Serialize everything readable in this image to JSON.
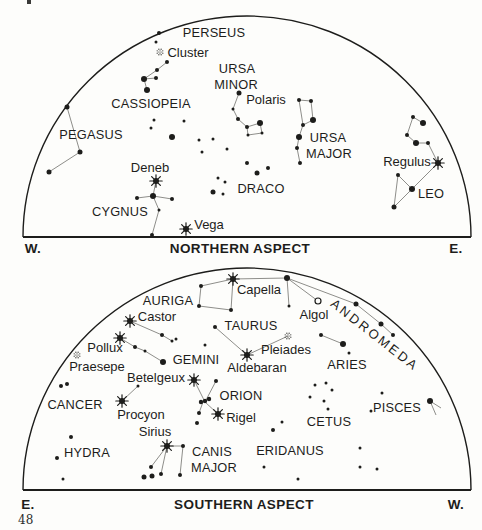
{
  "page": {
    "number": "48",
    "ink": "#1d1d1b",
    "line_gray": "#8e8e8a",
    "bg": "#fdfdfb"
  },
  "charts": [
    {
      "id": "northern-aspect",
      "arc": {
        "cx": 247,
        "cy": 237,
        "rx": 224,
        "ry": 221
      },
      "footer": {
        "left": "W.",
        "center": "NORTHERN ASPECT",
        "right": "E.",
        "y": 248,
        "left_x": 33,
        "center_x": 240,
        "right_x": 456
      },
      "labels": [
        {
          "t": "PERSEUS",
          "x": 214,
          "y": 32,
          "k": "con"
        },
        {
          "t": "Cluster",
          "x": 188,
          "y": 52,
          "k": "name"
        },
        {
          "t": "CASSIOPEIA",
          "x": 151,
          "y": 103,
          "k": "con"
        },
        {
          "t": "PEGASUS",
          "x": 91,
          "y": 134,
          "k": "con"
        },
        {
          "t": "URSA",
          "x": 237,
          "y": 68,
          "k": "con"
        },
        {
          "t": "MINOR",
          "x": 236,
          "y": 84,
          "k": "con"
        },
        {
          "t": "Polaris",
          "x": 266,
          "y": 99,
          "k": "name"
        },
        {
          "t": "URSA",
          "x": 328,
          "y": 137,
          "k": "con"
        },
        {
          "t": "MAJOR",
          "x": 329,
          "y": 153,
          "k": "con"
        },
        {
          "t": "DRACO",
          "x": 261,
          "y": 188,
          "k": "con"
        },
        {
          "t": "Deneb",
          "x": 150,
          "y": 167,
          "k": "name"
        },
        {
          "t": "CYGNUS",
          "x": 120,
          "y": 211,
          "k": "con"
        },
        {
          "t": "Vega",
          "x": 209,
          "y": 224,
          "k": "name"
        },
        {
          "t": "Regulus",
          "x": 407,
          "y": 161,
          "k": "name"
        },
        {
          "t": "LEO",
          "x": 431,
          "y": 193,
          "k": "con"
        }
      ],
      "stars": [
        [
          159,
          33,
          2
        ],
        [
          156,
          42,
          1.5
        ],
        [
          167,
          62,
          2
        ],
        [
          157,
          70,
          2
        ],
        [
          144,
          79,
          3
        ],
        [
          156,
          78,
          2
        ],
        [
          147,
          90,
          3
        ],
        [
          67,
          107,
          2.5
        ],
        [
          80,
          152,
          2.5
        ],
        [
          49,
          172,
          2.5
        ],
        [
          154,
          120,
          1.5
        ],
        [
          151,
          128,
          1.5
        ],
        [
          184,
          121,
          1.5
        ],
        [
          172,
          137,
          3
        ],
        [
          199,
          140,
          1.5
        ],
        [
          213,
          139,
          1.5
        ],
        [
          227,
          149,
          1.5
        ],
        [
          202,
          152,
          1.5
        ],
        [
          239,
          93,
          2.5
        ],
        [
          233,
          109,
          1.5
        ],
        [
          238,
          119,
          2
        ],
        [
          247,
          127,
          2
        ],
        [
          248,
          135,
          1.5
        ],
        [
          262,
          133,
          1.5
        ],
        [
          260,
          123,
          3
        ],
        [
          299,
          100,
          2
        ],
        [
          311,
          101,
          2
        ],
        [
          313,
          120,
          3
        ],
        [
          303,
          125,
          2
        ],
        [
          299,
          137,
          3
        ],
        [
          297,
          148,
          2
        ],
        [
          300,
          163,
          2
        ],
        [
          247,
          163,
          2
        ],
        [
          257,
          173,
          2.5
        ],
        [
          268,
          168,
          2
        ],
        [
          218,
          178,
          1.5
        ],
        [
          225,
          182,
          1.5
        ],
        [
          213,
          192,
          2.5
        ],
        [
          223,
          194,
          1.5
        ],
        [
          413,
          117,
          2
        ],
        [
          423,
          123,
          3
        ],
        [
          407,
          135,
          2
        ],
        [
          416,
          143,
          3
        ],
        [
          428,
          143,
          2
        ],
        [
          398,
          175,
          2
        ],
        [
          412,
          189,
          3
        ],
        [
          394,
          207,
          2.5
        ],
        [
          137,
          198,
          2
        ],
        [
          153,
          196,
          3
        ],
        [
          172,
          199,
          2
        ],
        [
          159,
          210,
          1.5
        ],
        [
          152,
          235,
          2
        ]
      ],
      "bursts": [
        {
          "n": "deneb",
          "x": 156,
          "y": 181
        },
        {
          "n": "vega",
          "x": 186,
          "y": 229
        },
        {
          "n": "regulus",
          "x": 438,
          "y": 163
        }
      ],
      "clusters": [
        {
          "n": "double-cluster",
          "x": 160,
          "y": 52
        }
      ],
      "open_circles": [],
      "lines": [
        [
          167,
          62,
          157,
          70
        ],
        [
          157,
          70,
          144,
          79
        ],
        [
          144,
          79,
          156,
          78
        ],
        [
          144,
          79,
          147,
          90
        ],
        [
          67,
          107,
          80,
          152
        ],
        [
          80,
          152,
          49,
          172
        ],
        [
          239,
          93,
          233,
          109
        ],
        [
          233,
          109,
          238,
          119
        ],
        [
          238,
          119,
          247,
          127
        ],
        [
          247,
          127,
          248,
          135
        ],
        [
          248,
          135,
          262,
          133
        ],
        [
          262,
          133,
          260,
          123
        ],
        [
          260,
          123,
          247,
          127
        ],
        [
          299,
          100,
          311,
          101
        ],
        [
          311,
          101,
          313,
          120
        ],
        [
          313,
          120,
          303,
          125
        ],
        [
          303,
          125,
          299,
          100
        ],
        [
          303,
          125,
          299,
          137
        ],
        [
          299,
          137,
          297,
          148
        ],
        [
          297,
          148,
          300,
          163
        ],
        [
          413,
          117,
          423,
          123
        ],
        [
          413,
          117,
          407,
          135
        ],
        [
          407,
          135,
          416,
          143
        ],
        [
          416,
          143,
          428,
          143
        ],
        [
          428,
          143,
          438,
          163
        ],
        [
          438,
          163,
          412,
          189
        ],
        [
          398,
          175,
          412,
          189
        ],
        [
          412,
          189,
          394,
          207
        ],
        [
          394,
          207,
          398,
          175
        ],
        [
          137,
          198,
          153,
          196
        ],
        [
          153,
          196,
          172,
          199
        ],
        [
          156,
          181,
          153,
          196
        ],
        [
          153,
          196,
          159,
          210
        ],
        [
          159,
          210,
          152,
          235
        ]
      ]
    },
    {
      "id": "southern-aspect",
      "arc": {
        "cx": 247,
        "cy": 490,
        "rx": 224,
        "ry": 222
      },
      "footer": {
        "left": "E.",
        "center": "SOUTHERN ASPECT",
        "right": "W.",
        "y": 504,
        "left_x": 28,
        "center_x": 244,
        "right_x": 456
      },
      "labels": [
        {
          "t": "AURIGA",
          "x": 168,
          "y": 300,
          "k": "con"
        },
        {
          "t": "Capella",
          "x": 259,
          "y": 289,
          "k": "name"
        },
        {
          "t": "Algol",
          "x": 314,
          "y": 314,
          "k": "name"
        },
        {
          "t": "ANDROMEDA",
          "x": 375,
          "y": 335,
          "k": "rot",
          "a": 38
        },
        {
          "t": "Castor",
          "x": 157,
          "y": 316,
          "k": "name"
        },
        {
          "t": "TAURUS",
          "x": 251,
          "y": 325,
          "k": "con"
        },
        {
          "t": "Pollux",
          "x": 105,
          "y": 347,
          "k": "name"
        },
        {
          "t": "Pleiades",
          "x": 286,
          "y": 349,
          "k": "name"
        },
        {
          "t": "Praesepe",
          "x": 97,
          "y": 366,
          "k": "name"
        },
        {
          "t": "GEMINI",
          "x": 196,
          "y": 359,
          "k": "con"
        },
        {
          "t": "Aldebaran",
          "x": 257,
          "y": 367,
          "k": "name"
        },
        {
          "t": "ARIES",
          "x": 347,
          "y": 364,
          "k": "con"
        },
        {
          "t": "Betelgeux",
          "x": 156,
          "y": 377,
          "k": "name"
        },
        {
          "t": "CANCER",
          "x": 75,
          "y": 404,
          "k": "con"
        },
        {
          "t": "ORION",
          "x": 241,
          "y": 395,
          "k": "con"
        },
        {
          "t": "Rigel",
          "x": 241,
          "y": 417,
          "k": "name"
        },
        {
          "t": "PISCES",
          "x": 397,
          "y": 407,
          "k": "con"
        },
        {
          "t": "Procyon",
          "x": 141,
          "y": 414,
          "k": "name"
        },
        {
          "t": "CETUS",
          "x": 329,
          "y": 421,
          "k": "con"
        },
        {
          "t": "Sirius",
          "x": 155,
          "y": 431,
          "k": "name"
        },
        {
          "t": "HYDRA",
          "x": 87,
          "y": 452,
          "k": "con"
        },
        {
          "t": "CANIS",
          "x": 212,
          "y": 451,
          "k": "con"
        },
        {
          "t": "MAJOR",
          "x": 214,
          "y": 467,
          "k": "con"
        },
        {
          "t": "ERIDANUS",
          "x": 290,
          "y": 450,
          "k": "con"
        }
      ],
      "stars": [
        [
          201,
          286,
          2
        ],
        [
          199,
          306,
          2
        ],
        [
          231,
          310,
          2
        ],
        [
          287,
          278,
          3
        ],
        [
          289,
          306,
          1.5
        ],
        [
          356,
          304,
          2.5
        ],
        [
          381,
          324,
          2.5
        ],
        [
          393,
          335,
          2
        ],
        [
          215,
          327,
          2
        ],
        [
          205,
          345,
          1.5
        ],
        [
          162,
          335,
          2
        ],
        [
          172,
          341,
          1.5
        ],
        [
          176,
          339,
          1.5
        ],
        [
          135,
          347,
          2
        ],
        [
          145,
          351,
          1.5
        ],
        [
          163,
          362,
          3
        ],
        [
          321,
          335,
          2
        ],
        [
          343,
          344,
          3
        ],
        [
          349,
          353,
          1.5
        ],
        [
          61,
          386,
          2
        ],
        [
          67,
          384,
          2
        ],
        [
          138,
          386,
          1.5
        ],
        [
          216,
          381,
          2
        ],
        [
          201,
          402,
          2.2
        ],
        [
          205,
          401,
          2.2
        ],
        [
          209,
          399,
          2.2
        ],
        [
          199,
          413,
          2
        ],
        [
          197,
          423,
          2
        ],
        [
          183,
          446,
          2
        ],
        [
          151,
          467,
          2
        ],
        [
          144,
          477,
          2.5
        ],
        [
          152,
          476,
          2.5
        ],
        [
          161,
          474,
          2
        ],
        [
          180,
          475,
          2
        ],
        [
          71,
          437,
          2
        ],
        [
          57,
          458,
          2
        ],
        [
          63,
          479,
          1.5
        ],
        [
          315,
          385,
          1.5
        ],
        [
          326,
          383,
          1.5
        ],
        [
          332,
          390,
          1.5
        ],
        [
          310,
          397,
          1.5
        ],
        [
          324,
          401,
          1.5
        ],
        [
          328,
          409,
          1.5
        ],
        [
          282,
          422,
          1.5
        ],
        [
          273,
          430,
          2
        ],
        [
          264,
          467,
          1.5
        ],
        [
          298,
          479,
          1.5
        ],
        [
          360,
          448,
          1.5
        ],
        [
          360,
          467,
          1.5
        ],
        [
          377,
          469,
          1.5
        ],
        [
          382,
          393,
          1.5
        ],
        [
          371,
          411,
          1.5
        ],
        [
          430,
          401,
          3
        ]
      ],
      "bursts": [
        {
          "n": "capella",
          "x": 233,
          "y": 279
        },
        {
          "n": "castor",
          "x": 130,
          "y": 321
        },
        {
          "n": "pollux",
          "x": 120,
          "y": 338
        },
        {
          "n": "aldebaran",
          "x": 247,
          "y": 355
        },
        {
          "n": "betelgeux",
          "x": 194,
          "y": 380
        },
        {
          "n": "rigel",
          "x": 218,
          "y": 414
        },
        {
          "n": "procyon",
          "x": 122,
          "y": 401
        },
        {
          "n": "sirius",
          "x": 167,
          "y": 446
        }
      ],
      "clusters": [
        {
          "n": "pleiades",
          "x": 288,
          "y": 336
        },
        {
          "n": "praesepe",
          "x": 77,
          "y": 355
        }
      ],
      "open_circles": [
        {
          "n": "algol",
          "x": 318,
          "y": 301
        }
      ],
      "lines": [
        [
          233,
          279,
          201,
          286
        ],
        [
          201,
          286,
          199,
          306
        ],
        [
          199,
          306,
          231,
          310
        ],
        [
          231,
          310,
          233,
          279
        ],
        [
          233,
          279,
          287,
          278
        ],
        [
          287,
          278,
          289,
          306
        ],
        [
          287,
          278,
          318,
          301
        ],
        [
          287,
          278,
          356,
          304
        ],
        [
          356,
          304,
          381,
          324
        ],
        [
          381,
          324,
          393,
          335
        ],
        [
          247,
          355,
          215,
          327
        ],
        [
          247,
          355,
          288,
          336
        ],
        [
          130,
          321,
          162,
          335
        ],
        [
          162,
          335,
          172,
          341
        ],
        [
          120,
          338,
          135,
          347
        ],
        [
          135,
          347,
          145,
          351
        ],
        [
          145,
          351,
          163,
          362
        ],
        [
          321,
          335,
          343,
          344
        ],
        [
          194,
          380,
          204,
          400
        ],
        [
          216,
          381,
          206,
          400
        ],
        [
          205,
          402,
          218,
          414
        ],
        [
          203,
          402,
          199,
          413
        ],
        [
          122,
          401,
          138,
          386
        ],
        [
          167,
          446,
          183,
          446
        ],
        [
          167,
          446,
          151,
          467
        ],
        [
          167,
          446,
          161,
          474
        ],
        [
          183,
          446,
          180,
          475
        ],
        [
          430,
          401,
          441,
          408
        ],
        [
          430,
          401,
          436,
          415
        ]
      ]
    }
  ]
}
